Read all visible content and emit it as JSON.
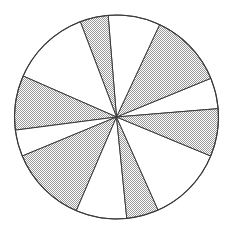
{
  "figure": {
    "kind": "pie-sector-diagram",
    "background_color": "#ffffff",
    "outline_color": "#3a3a3a",
    "shaded_fill_color": "#d4d4d4",
    "unshaded_fill_color": "#ffffff",
    "shaded_pattern": "stipple-dots",
    "center_x": 116.5,
    "center_y": 117,
    "radius": 102,
    "sector_count": 12,
    "shaded_sector_count": 6,
    "unshaded_sector_count": 6
  },
  "chart_data": {
    "type": "pie",
    "xlabel": "",
    "ylabel": "",
    "grid": false,
    "legend": false,
    "legend_position": "none",
    "units": "degrees",
    "total_degrees": 360,
    "categories": [
      "sector-1",
      "sector-2",
      "sector-3",
      "sector-4",
      "sector-5",
      "sector-6",
      "sector-7",
      "sector-8",
      "sector-9",
      "sector-10",
      "sector-11",
      "sector-12"
    ],
    "values": [
      17.6,
      42.7,
      29.7,
      16.1,
      45.5,
      31.1,
      15.1,
      44.3,
      29.0,
      18.3,
      43.4,
      27.2
    ],
    "slices": [
      {
        "name": "sector-1",
        "start_deg": 4.7,
        "end_deg": 22.3,
        "sweep_deg": 17.6,
        "shaded": false,
        "fill": "#ffffff"
      },
      {
        "name": "sector-2",
        "start_deg": 22.3,
        "end_deg": 65.0,
        "sweep_deg": 42.7,
        "shaded": true,
        "fill": "#d4d4d4"
      },
      {
        "name": "sector-3",
        "start_deg": 65.0,
        "end_deg": 94.7,
        "sweep_deg": 29.7,
        "shaded": false,
        "fill": "#ffffff"
      },
      {
        "name": "sector-4",
        "start_deg": 94.7,
        "end_deg": 110.8,
        "sweep_deg": 16.1,
        "shaded": true,
        "fill": "#d4d4d4"
      },
      {
        "name": "sector-5",
        "start_deg": 110.8,
        "end_deg": 156.3,
        "sweep_deg": 45.5,
        "shaded": false,
        "fill": "#ffffff"
      },
      {
        "name": "sector-6",
        "start_deg": 156.3,
        "end_deg": 187.4,
        "sweep_deg": 31.1,
        "shaded": true,
        "fill": "#d4d4d4"
      },
      {
        "name": "sector-7",
        "start_deg": 187.4,
        "end_deg": 202.5,
        "sweep_deg": 15.1,
        "shaded": false,
        "fill": "#ffffff"
      },
      {
        "name": "sector-8",
        "start_deg": 202.5,
        "end_deg": 246.8,
        "sweep_deg": 44.3,
        "shaded": true,
        "fill": "#d4d4d4"
      },
      {
        "name": "sector-9",
        "start_deg": 246.8,
        "end_deg": 275.8,
        "sweep_deg": 29.0,
        "shaded": false,
        "fill": "#ffffff"
      },
      {
        "name": "sector-10",
        "start_deg": 275.8,
        "end_deg": 294.1,
        "sweep_deg": 18.3,
        "shaded": true,
        "fill": "#d4d4d4"
      },
      {
        "name": "sector-11",
        "start_deg": 294.1,
        "end_deg": 337.5,
        "sweep_deg": 43.4,
        "shaded": false,
        "fill": "#ffffff"
      },
      {
        "name": "sector-12",
        "start_deg": 337.5,
        "end_deg": 364.7,
        "sweep_deg": 27.2,
        "shaded": true,
        "fill": "#d4d4d4"
      }
    ]
  }
}
